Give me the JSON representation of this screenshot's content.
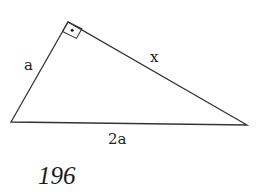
{
  "diagram": {
    "type": "right-triangle",
    "vertices": {
      "top": [
        68,
        22
      ],
      "left": [
        11,
        122
      ],
      "right": [
        247,
        125
      ]
    },
    "right_angle_at": "top",
    "labels": {
      "leg_short": "a",
      "leg_long": "x",
      "hypotenuse": "2a"
    },
    "stroke_color": "#333333"
  },
  "page": {
    "number": "196"
  }
}
